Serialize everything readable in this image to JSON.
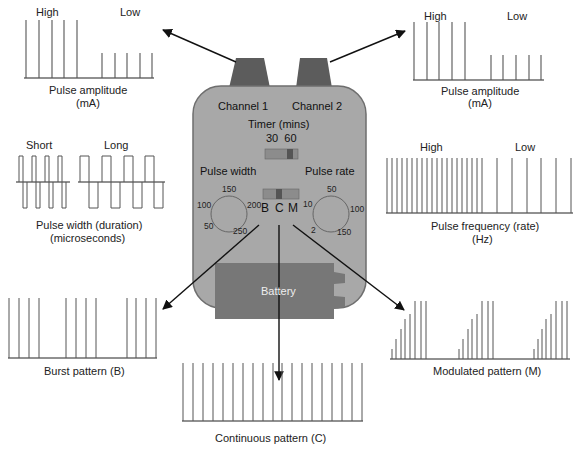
{
  "colors": {
    "device_body": "#a8a8a8",
    "device_outline": "#6e6e6e",
    "connector": "#5c5c5c",
    "battery": "#777777",
    "switch_bg": "#8a8a8a",
    "switch_knob": "#555555",
    "wave_line": "#555555",
    "arrow": "#111111"
  },
  "device": {
    "channel1": "Channel 1",
    "channel2": "Channel 2",
    "timer_title": "Timer (mins)",
    "timer_values": "30  60",
    "pulse_width_label": "Pulse width",
    "pulse_rate_label": "Pulse rate",
    "width_dial": {
      "t": "150",
      "l": "100",
      "r": "200",
      "bl": "50",
      "br": "250"
    },
    "rate_dial": {
      "t": "50",
      "l": "10",
      "r": "100",
      "bl": "2",
      "br": "150"
    },
    "mode_b": "B",
    "mode_c": "C",
    "mode_m": "M",
    "battery_label": "Battery"
  },
  "panels": {
    "amp_left": {
      "high": "High",
      "low": "Low",
      "caption1": "Pulse amplitude",
      "caption2": "(mA)"
    },
    "amp_right": {
      "high": "High",
      "low": "Low",
      "caption1": "Pulse amplitude",
      "caption2": "(mA)"
    },
    "width": {
      "short": "Short",
      "long": "Long",
      "caption1": "Pulse width (duration)",
      "caption2": "(microseconds)"
    },
    "frequency": {
      "high": "High",
      "low": "Low",
      "caption1": "Pulse frequency (rate)",
      "caption2": "(Hz)"
    },
    "burst": {
      "caption": "Burst pattern (B)"
    },
    "continuous": {
      "caption": "Continuous pattern (C)"
    },
    "modulated": {
      "caption": "Modulated pattern (M)"
    }
  }
}
